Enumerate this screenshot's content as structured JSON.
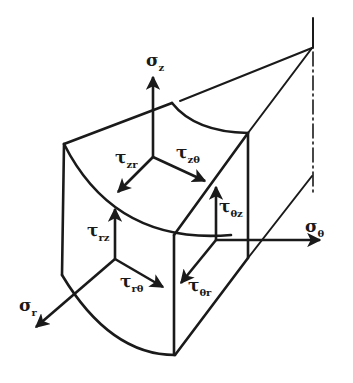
{
  "diagram": {
    "colors": {
      "ink": "#1a1a1a",
      "background": "#ffffff"
    },
    "labels": {
      "sigma_z": {
        "symbol": "σ",
        "sub": "z"
      },
      "sigma_r": {
        "symbol": "σ",
        "sub": "r"
      },
      "sigma_th": {
        "symbol": "σ",
        "sub": "θ"
      },
      "tau_zr": {
        "symbol": "τ",
        "sub": "zr"
      },
      "tau_zth": {
        "symbol": "τ",
        "sub": "zθ"
      },
      "tau_rz": {
        "symbol": "τ",
        "sub": "rz"
      },
      "tau_rth": {
        "symbol": "τ",
        "sub": "rθ"
      },
      "tau_thz": {
        "symbol": "τ",
        "sub": "θz"
      },
      "tau_thr": {
        "symbol": "τ",
        "sub": "θr"
      }
    }
  }
}
